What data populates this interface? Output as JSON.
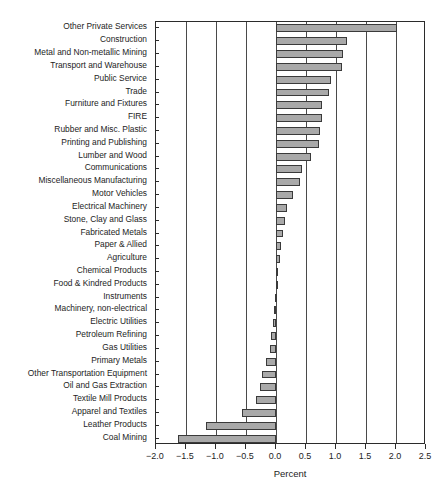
{
  "chart_data": {
    "type": "bar",
    "orientation": "horizontal",
    "title": "",
    "xlabel": "Percent",
    "ylabel": "",
    "xlim": [
      -2.0,
      2.5
    ],
    "xticks": [
      -2.0,
      -1.5,
      -1.0,
      -0.5,
      0.0,
      0.5,
      1.0,
      1.5,
      2.0,
      2.5
    ],
    "xticklabels": [
      "−2.0",
      "−1.5",
      "−1.0",
      "−0.5",
      "0.0",
      "0.5",
      "1.0",
      "1.5",
      "2.0",
      "2.5"
    ],
    "grid": true,
    "grid_axis": "x",
    "legend": false,
    "bar_fill": "#a9a9a9",
    "bar_edge": "#3a3a3a",
    "categories": [
      "Other Private Services",
      "Construction",
      "Metal and Non-metallic Mining",
      "Transport and Warehouse",
      "Public Service",
      "Trade",
      "Furniture and Fixtures",
      "FIRE",
      "Rubber and Misc. Plastic",
      "Printing and Publishing",
      "Lumber and Wood",
      "Communications",
      "Miscellaneous Manufacturing",
      "Motor Vehicles",
      "Electrical Machinery",
      "Stone, Clay and Glass",
      "Fabricated Metals",
      "Paper & Allied",
      "Agriculture",
      "Chemical Products",
      "Food & Kindred Products",
      "Instruments",
      "Machinery, non-electrical",
      "Electric Utilities",
      "Petroleum Refining",
      "Gas Utilities",
      "Primary Metals",
      "Other Transportation Equipment",
      "Oil and Gas Extraction",
      "Textile Mill Products",
      "Apparel and Textiles",
      "Leather Products",
      "Coal Mining"
    ],
    "values": [
      2.02,
      1.18,
      1.12,
      1.1,
      0.92,
      0.89,
      0.76,
      0.76,
      0.74,
      0.72,
      0.58,
      0.43,
      0.4,
      0.28,
      0.18,
      0.15,
      0.12,
      0.08,
      0.06,
      0.04,
      0.02,
      -0.01,
      -0.03,
      -0.05,
      -0.08,
      -0.1,
      -0.17,
      -0.24,
      -0.26,
      -0.33,
      -0.56,
      -1.17,
      -1.64
    ]
  }
}
